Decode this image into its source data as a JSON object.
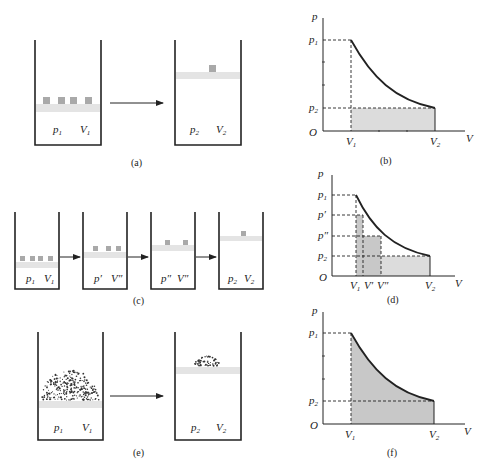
{
  "figure": {
    "panels": {
      "a": {
        "caption": "(a)",
        "containers": [
          {
            "p": "p",
            "p_sub": "1",
            "V": "V",
            "V_sub": "1",
            "weights": 4
          },
          {
            "p": "p",
            "p_sub": "2",
            "V": "V",
            "V_sub": "2",
            "weights": 1
          }
        ]
      },
      "b": {
        "caption": "(b)",
        "y_axis": "p",
        "x_axis": "V",
        "origin": "O",
        "y_ticks": [
          {
            "label": "p",
            "sub": "1"
          },
          {
            "label": "p",
            "sub": "2"
          }
        ],
        "x_ticks": [
          {
            "label": "V",
            "sub": "1"
          },
          {
            "label": "V",
            "sub": "2"
          }
        ],
        "shaded_region": "rectangle under p2 from V1 to V2"
      },
      "c": {
        "caption": "(c)",
        "containers": [
          {
            "p": "p",
            "p_sub": "1",
            "V": "V",
            "V_sub": "1",
            "weights": 4
          },
          {
            "p": "p′",
            "p_sub": "",
            "V": "V″",
            "V_sub": "",
            "weights": 3
          },
          {
            "p": "p″",
            "p_sub": "",
            "V": "V″",
            "V_sub": "",
            "weights": 2
          },
          {
            "p": "p",
            "p_sub": "2",
            "V": "V",
            "V_sub": "2",
            "weights": 1
          }
        ]
      },
      "d": {
        "caption": "(d)",
        "y_axis": "p",
        "x_axis": "V",
        "origin": "O",
        "y_ticks": [
          {
            "label": "p",
            "sub": "1"
          },
          {
            "label": "p′",
            "sub": ""
          },
          {
            "label": "p″",
            "sub": ""
          },
          {
            "label": "p",
            "sub": "2"
          }
        ],
        "x_ticks": [
          {
            "label": "V",
            "sub": "1"
          },
          {
            "label": "V′",
            "sub": ""
          },
          {
            "label": "V″",
            "sub": ""
          },
          {
            "label": "V",
            "sub": "2"
          }
        ],
        "shaded_region": "staircase of three rectangles under the curve"
      },
      "e": {
        "caption": "(e)",
        "containers": [
          {
            "p": "p",
            "p_sub": "1",
            "V": "V",
            "V_sub": "1",
            "load": "sand pile (large)"
          },
          {
            "p": "p",
            "p_sub": "2",
            "V": "V",
            "V_sub": "2",
            "load": "sand pile (small)"
          }
        ]
      },
      "f": {
        "caption": "(f)",
        "y_axis": "p",
        "x_axis": "V",
        "origin": "O",
        "y_ticks": [
          {
            "label": "p",
            "sub": "1"
          },
          {
            "label": "p",
            "sub": "2"
          }
        ],
        "x_ticks": [
          {
            "label": "V",
            "sub": "1"
          },
          {
            "label": "V",
            "sub": "2"
          }
        ],
        "shaded_region": "full area under curve from V1 to V2"
      }
    }
  }
}
